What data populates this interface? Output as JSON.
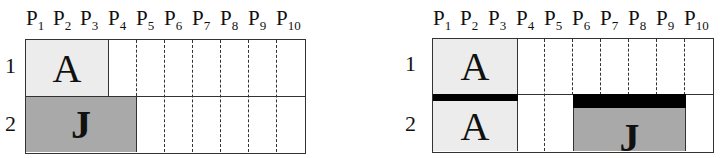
{
  "left_panel": {
    "processors": [
      "P",
      "P",
      "P",
      "P",
      "P",
      "P",
      "P",
      "P",
      "P",
      "P"
    ],
    "processor_subscripts": [
      "1",
      "2",
      "3",
      "4",
      "5",
      "6",
      "7",
      "8",
      "9",
      "10"
    ],
    "rows": [
      "1",
      "2"
    ],
    "blocks": [
      {
        "label": "A",
        "row": 1,
        "start_col": 1,
        "end_col": 3,
        "fill": "#ececec"
      },
      {
        "label": "J",
        "row": 2,
        "start_col": 1,
        "end_col": 4,
        "fill": "#a9a9a9"
      }
    ]
  },
  "right_panel": {
    "processors": [
      "P",
      "P",
      "P",
      "P",
      "P",
      "P",
      "P",
      "P",
      "P",
      "P"
    ],
    "processor_subscripts": [
      "1",
      "2",
      "3",
      "4",
      "5",
      "6",
      "7",
      "8",
      "9",
      "10"
    ],
    "rows": [
      "1",
      "2"
    ],
    "blocks": [
      {
        "label": "A",
        "row": 1,
        "start_col": 1,
        "end_col": 3,
        "fill": "#ececec"
      },
      {
        "label": "A",
        "row": 2,
        "start_col": 1,
        "end_col": 3,
        "fill": "#ececec"
      },
      {
        "label": "J",
        "row": 2,
        "start_col": 6,
        "end_col": 9,
        "fill": "#a9a9a9"
      }
    ],
    "bars": [
      {
        "row": 2,
        "start_col": 1,
        "end_col": 3,
        "color": "#000000"
      },
      {
        "row": 2,
        "start_col": 6,
        "end_col": 9,
        "color": "#000000"
      }
    ]
  }
}
